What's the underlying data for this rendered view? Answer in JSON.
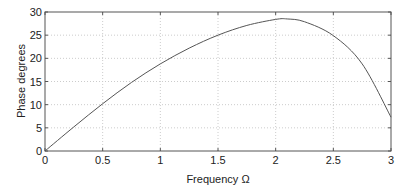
{
  "chart_data": {
    "type": "line",
    "title": "",
    "xlabel": "Frequency Ω",
    "ylabel": "Phase degrees",
    "xlim": [
      0,
      3
    ],
    "ylim": [
      0,
      30
    ],
    "xticks": [
      "0",
      "0.5",
      "1",
      "1.5",
      "2",
      "2.5",
      "3"
    ],
    "yticks": [
      "0",
      "5",
      "10",
      "15",
      "20",
      "25",
      "30"
    ],
    "grid": true,
    "legend": null,
    "series": [
      {
        "name": "phase",
        "color": "#555555",
        "x": [
          0,
          0.25,
          0.5,
          0.75,
          1.0,
          1.25,
          1.5,
          1.75,
          2.0,
          2.1,
          2.25,
          2.5,
          2.75,
          3.0
        ],
        "y": [
          0,
          5.2,
          10.2,
          14.8,
          18.8,
          22.2,
          25.0,
          27.1,
          28.4,
          28.5,
          27.9,
          24.9,
          18.8,
          7.3
        ]
      }
    ]
  }
}
